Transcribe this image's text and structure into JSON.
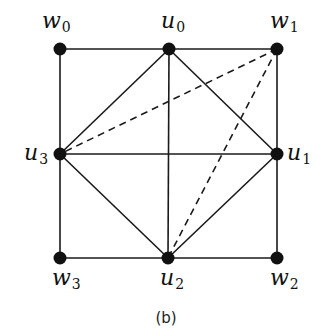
{
  "diagram": {
    "caption": "(b)",
    "nodes": [
      {
        "id": "w0",
        "base": "w",
        "sub": "0",
        "x": 60,
        "y": 49,
        "lx": 42,
        "ly": 28
      },
      {
        "id": "u0",
        "base": "u",
        "sub": "0",
        "x": 169,
        "y": 49,
        "lx": 161,
        "ly": 28
      },
      {
        "id": "w1",
        "base": "w",
        "sub": "1",
        "x": 277,
        "y": 49,
        "lx": 270,
        "ly": 28
      },
      {
        "id": "u3",
        "base": "u",
        "sub": "3",
        "x": 60,
        "y": 154,
        "lx": 24,
        "ly": 160
      },
      {
        "id": "u1",
        "base": "u",
        "sub": "1",
        "x": 277,
        "y": 154,
        "lx": 287,
        "ly": 160
      },
      {
        "id": "w3",
        "base": "w",
        "sub": "3",
        "x": 60,
        "y": 258,
        "lx": 52,
        "ly": 285
      },
      {
        "id": "u2",
        "base": "u",
        "sub": "2",
        "x": 168,
        "y": 258,
        "lx": 160,
        "ly": 285
      },
      {
        "id": "w2",
        "base": "w",
        "sub": "2",
        "x": 277,
        "y": 258,
        "lx": 270,
        "ly": 285
      }
    ],
    "edges": [
      {
        "from": "w0",
        "to": "u0",
        "style": "solid"
      },
      {
        "from": "u0",
        "to": "w1",
        "style": "solid"
      },
      {
        "from": "w1",
        "to": "u1",
        "style": "solid"
      },
      {
        "from": "u1",
        "to": "w2",
        "style": "solid"
      },
      {
        "from": "w2",
        "to": "u2",
        "style": "solid"
      },
      {
        "from": "u2",
        "to": "w3",
        "style": "solid"
      },
      {
        "from": "w3",
        "to": "u3",
        "style": "solid"
      },
      {
        "from": "u3",
        "to": "w0",
        "style": "solid"
      },
      {
        "from": "u0",
        "to": "u2",
        "style": "solid"
      },
      {
        "from": "u3",
        "to": "u1",
        "style": "solid"
      },
      {
        "from": "u0",
        "to": "u1",
        "style": "solid"
      },
      {
        "from": "u1",
        "to": "u2",
        "style": "solid"
      },
      {
        "from": "u2",
        "to": "u3",
        "style": "solid"
      },
      {
        "from": "u3",
        "to": "u0",
        "style": "solid"
      },
      {
        "from": "w1",
        "to": "u3",
        "style": "dashed"
      },
      {
        "from": "w1",
        "to": "u2",
        "style": "dashed"
      }
    ],
    "node_color": "#111111",
    "edge_color": "#1a1a1a"
  }
}
